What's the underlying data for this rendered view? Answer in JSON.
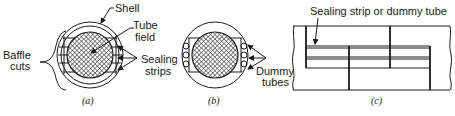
{
  "figure": {
    "panels": [
      {
        "id": "a",
        "caption": "(a)",
        "labels": {
          "shell": "Shell",
          "tube_field_line1": "Tube",
          "tube_field_line2": "field",
          "sealing_strips_line1": "Sealing",
          "sealing_strips_line2": "strips",
          "baffle_cuts_line1": "Baffle",
          "baffle_cuts_line2": "cuts"
        }
      },
      {
        "id": "b",
        "caption": "(b)",
        "labels": {
          "dummy_tubes_line1": "Dummy",
          "dummy_tubes_line2": "tubes"
        }
      },
      {
        "id": "c",
        "caption": "(c)",
        "labels": {
          "sealing_strip_or_dummy_tube": "Sealing strip or dummy tube"
        }
      }
    ],
    "colors": {
      "ink": "#1a1a1a",
      "background": "#ffffff"
    }
  }
}
